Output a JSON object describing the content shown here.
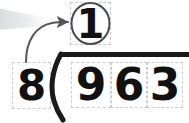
{
  "problem": {
    "kind": "long-division",
    "divisor": "8",
    "dividend_digits": [
      "9",
      "6",
      "3"
    ],
    "quotient_digits": [
      "1"
    ],
    "statement": "8 ) 963"
  },
  "quotient": {
    "value": "1",
    "highlighted": true,
    "highlight_shape": "ellipse"
  },
  "divisor": {
    "value": "8"
  },
  "dividend": {
    "digits": [
      "9",
      "6",
      "3"
    ]
  },
  "annotation": {
    "arrow": "curved-arrow-divisor-to-quotient",
    "direction": "up-right"
  },
  "colors": {
    "ink": "#111111",
    "slot_border": "#c9ccd1",
    "bracket": "#1a1a1a",
    "arrow": "#55565a",
    "circle": "#4a4b50",
    "glow": "#e3e4e6",
    "background": "#ffffff"
  }
}
